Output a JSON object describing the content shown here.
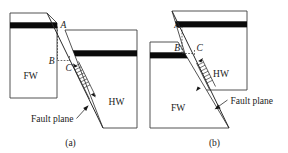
{
  "figure": {
    "name": "fault-block-diagrams",
    "background_color": "#ffffff",
    "line_color": "#2b2b2b",
    "outline_color": "#3f3f3f",
    "marker_bed_color": "#0a0a0a"
  },
  "panels": [
    {
      "id": "a",
      "caption": "(a)",
      "fault_type": "normal",
      "labels": {
        "point_a": "A",
        "point_b": "B",
        "point_c": "C",
        "footwall": "FW",
        "hanging_wall": "HW",
        "fault_plane": "Fault plane"
      }
    },
    {
      "id": "b",
      "caption": "(b)",
      "fault_type": "reverse",
      "labels": {
        "point_a": "A",
        "point_b": "B",
        "point_c": "C",
        "footwall": "FW",
        "hanging_wall": "HW",
        "fault_plane": "Fault plane"
      }
    }
  ]
}
